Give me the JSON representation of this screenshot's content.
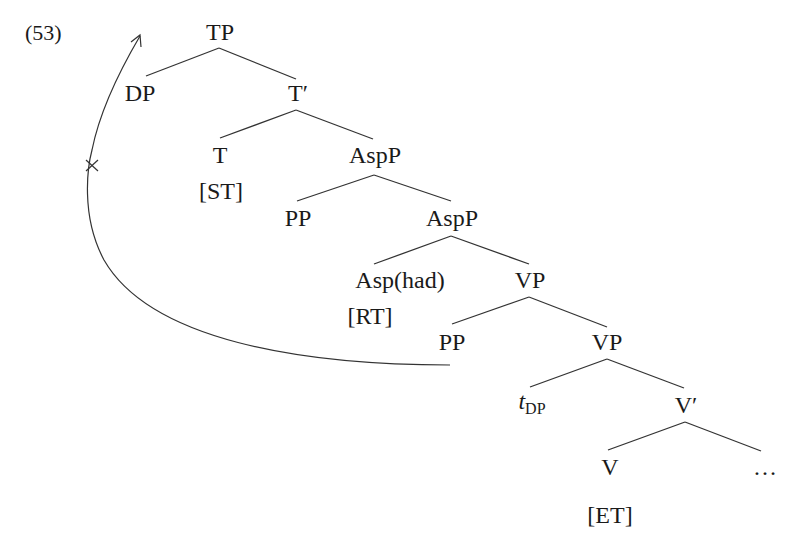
{
  "example_number": "(53)",
  "tree": {
    "TP": "TP",
    "DP": "DP",
    "T_bar": "T′",
    "T": "T",
    "T_feature": "[ST]",
    "AspP_upper": "AspP",
    "PP_upper": "PP",
    "AspP_lower": "AspP",
    "Asp": "Asp",
    "Asp_lexical": "(had)",
    "Asp_feature": "[RT]",
    "VP_upper": "VP",
    "PP_lower": "PP",
    "VP_lower": "VP",
    "trace": "t",
    "trace_subscript": "DP",
    "V_bar": "V′",
    "V": "V",
    "V_feature": "[ET]",
    "ellipsis": "…"
  },
  "movement_arrow": {
    "from": "PP_lower",
    "to": "above TP",
    "blocked_mark": "×"
  }
}
